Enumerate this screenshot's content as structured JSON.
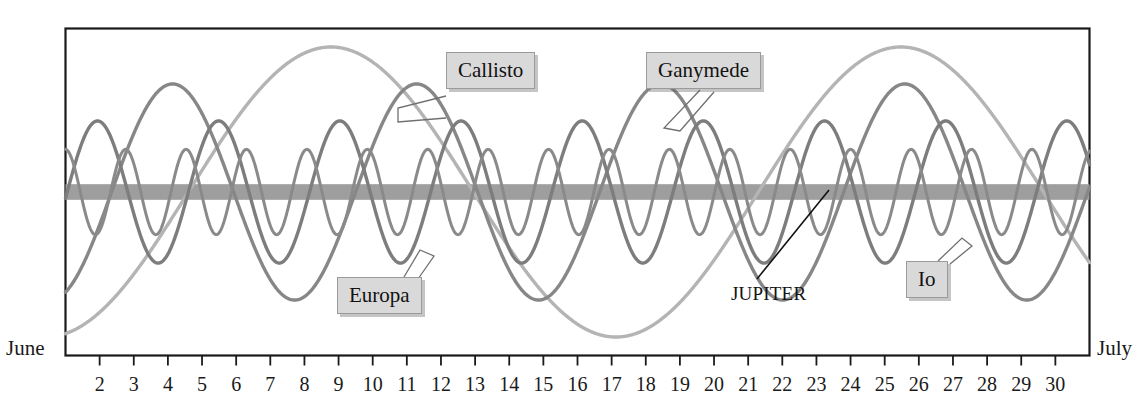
{
  "figure": {
    "axis_start_label": "June",
    "axis_end_label": "July",
    "tick_labels": [
      "2",
      "3",
      "4",
      "5",
      "6",
      "7",
      "8",
      "9",
      "10",
      "11",
      "12",
      "13",
      "14",
      "15",
      "16",
      "17",
      "18",
      "19",
      "20",
      "21",
      "22",
      "23",
      "24",
      "25",
      "26",
      "27",
      "28",
      "29",
      "30"
    ]
  },
  "labels": {
    "callisto": "Callisto",
    "ganymede": "Ganymede",
    "europa": "Europa",
    "io": "Io",
    "jupiter": "JUPITER"
  },
  "colors": {
    "frame": "#1a1a1a",
    "jupiter_band": "#9e9e9e",
    "io_curve": "#8a8a8a",
    "europa_curve": "#7d7d7d",
    "ganymede_curve": "#878787",
    "callisto_curve": "#b4b4b4",
    "callout_fill": "#d9d9d9",
    "callout_border": "#9a9a9a",
    "text": "#121212",
    "background": "#ffffff"
  },
  "chart_data": {
    "type": "line",
    "title": "",
    "subtitle": "",
    "xlabel": "",
    "ylabel": "",
    "grid": false,
    "legend_position": "inline-callouts",
    "x_axis": {
      "label_left": "June",
      "label_right": "July",
      "tick_values": [
        2,
        3,
        4,
        5,
        6,
        7,
        8,
        9,
        10,
        11,
        12,
        13,
        14,
        15,
        16,
        17,
        18,
        19,
        20,
        21,
        22,
        23,
        24,
        25,
        26,
        27,
        28,
        29,
        30
      ],
      "xlim": [
        1,
        31
      ],
      "unit": "day of month"
    },
    "y_axis": {
      "description": "Apparent east-west offset from Jupiter",
      "ylim": [
        -1.15,
        1.15
      ],
      "tick_values": [],
      "zero_line": "Jupiter"
    },
    "annotations": [
      {
        "text": "Callisto",
        "type": "callout-box",
        "points_to": "callisto-curve"
      },
      {
        "text": "Ganymede",
        "type": "callout-box",
        "points_to": "ganymede-curve"
      },
      {
        "text": "Europa",
        "type": "callout-box",
        "points_to": "europa-curve"
      },
      {
        "text": "Io",
        "type": "callout-box",
        "points_to": "io-curve"
      },
      {
        "text": "JUPITER",
        "type": "plain-text-leader",
        "points_to": "jupiter-band"
      }
    ],
    "series": [
      {
        "name": "Io",
        "waveform": "sine",
        "period_days": 1.77,
        "amplitude": 0.3,
        "phase_days": 0.55,
        "color": "#8a8a8a",
        "line_width": 3.0
      },
      {
        "name": "Europa",
        "waveform": "sine",
        "period_days": 3.55,
        "amplitude": 0.5,
        "phase_days": 1.05,
        "color": "#7d7d7d",
        "line_width": 3.4
      },
      {
        "name": "Ganymede",
        "waveform": "sine",
        "period_days": 7.15,
        "amplitude": 0.76,
        "phase_days": 2.35,
        "color": "#878787",
        "line_width": 3.4
      },
      {
        "name": "Callisto",
        "waveform": "sine",
        "period_days": 16.7,
        "amplitude": 1.02,
        "phase_days": 4.6,
        "color": "#b4b4b4",
        "line_width": 3.4
      },
      {
        "name": "Jupiter",
        "waveform": "constant-band",
        "value": 0,
        "band_half_width": 0.055,
        "color": "#9e9e9e"
      }
    ]
  }
}
